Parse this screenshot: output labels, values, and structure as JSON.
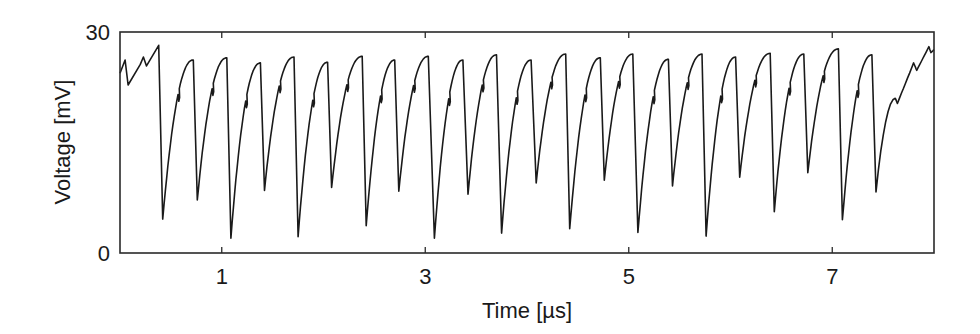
{
  "chart_data": {
    "type": "line",
    "title": "",
    "xlabel": "Time [µs]",
    "ylabel": "Voltage [mV]",
    "xlim": [
      0,
      8.0
    ],
    "ylim": [
      0,
      30
    ],
    "x_ticks": [
      1,
      3,
      5,
      7
    ],
    "x_tick_labels": [
      "1",
      "3",
      "5",
      "7"
    ],
    "y_ticks": [
      0,
      30
    ],
    "y_tick_labels": [
      "0",
      "30"
    ],
    "grid": false,
    "legend": null,
    "line_color": "#1a1a1a",
    "series": [
      {
        "name": "voltage",
        "description": "Sawtooth-like oscillation: slow concave rise with a small notch, then abrupt drop",
        "start": {
          "t": 0.0,
          "v": 24.4
        },
        "initial_segment": [
          {
            "t": 0.0,
            "v": 24.4
          },
          {
            "t": 0.05,
            "v": 26.2
          },
          {
            "t": 0.08,
            "v": 22.8
          },
          {
            "t": 0.2,
            "v": 25.6
          },
          {
            "t": 0.23,
            "v": 26.6
          },
          {
            "t": 0.26,
            "v": 25.4
          },
          {
            "t": 0.38,
            "v": 28.2
          }
        ],
        "peaks": [
          {
            "t": 0.38,
            "v": 28.2
          },
          {
            "t": 0.72,
            "v": 26.2
          },
          {
            "t": 1.05,
            "v": 26.5
          },
          {
            "t": 1.38,
            "v": 25.8
          },
          {
            "t": 1.71,
            "v": 26.6
          },
          {
            "t": 2.04,
            "v": 25.9
          },
          {
            "t": 2.38,
            "v": 26.7
          },
          {
            "t": 2.7,
            "v": 26.2
          },
          {
            "t": 3.03,
            "v": 26.7
          },
          {
            "t": 3.37,
            "v": 26.2
          },
          {
            "t": 3.7,
            "v": 26.9
          },
          {
            "t": 4.04,
            "v": 26.2
          },
          {
            "t": 4.38,
            "v": 27.0
          },
          {
            "t": 4.72,
            "v": 26.5
          },
          {
            "t": 5.04,
            "v": 27.0
          },
          {
            "t": 5.39,
            "v": 26.3
          },
          {
            "t": 5.72,
            "v": 27.0
          },
          {
            "t": 6.05,
            "v": 26.6
          },
          {
            "t": 6.39,
            "v": 27.1
          },
          {
            "t": 6.72,
            "v": 27.0
          },
          {
            "t": 7.06,
            "v": 27.7
          },
          {
            "t": 7.39,
            "v": 26.9
          }
        ],
        "troughs": [
          {
            "t": 0.42,
            "v": 4.6
          },
          {
            "t": 0.76,
            "v": 7.2
          },
          {
            "t": 1.09,
            "v": 2.0
          },
          {
            "t": 1.42,
            "v": 8.5
          },
          {
            "t": 1.75,
            "v": 2.2
          },
          {
            "t": 2.08,
            "v": 8.9
          },
          {
            "t": 2.42,
            "v": 3.7
          },
          {
            "t": 2.74,
            "v": 8.4
          },
          {
            "t": 3.09,
            "v": 2.0
          },
          {
            "t": 3.42,
            "v": 8.0
          },
          {
            "t": 3.75,
            "v": 2.7
          },
          {
            "t": 4.09,
            "v": 9.5
          },
          {
            "t": 4.42,
            "v": 3.3
          },
          {
            "t": 4.76,
            "v": 9.9
          },
          {
            "t": 5.09,
            "v": 2.8
          },
          {
            "t": 5.43,
            "v": 9.1
          },
          {
            "t": 5.76,
            "v": 2.3
          },
          {
            "t": 6.09,
            "v": 10.3
          },
          {
            "t": 6.43,
            "v": 5.6
          },
          {
            "t": 6.76,
            "v": 10.9
          },
          {
            "t": 7.1,
            "v": 4.5
          },
          {
            "t": 7.43,
            "v": 8.3
          }
        ],
        "final_segment": [
          {
            "t": 7.43,
            "v": 8.3
          },
          {
            "t": 7.62,
            "v": 21.0
          },
          {
            "t": 7.64,
            "v": 20.3
          },
          {
            "t": 7.8,
            "v": 25.8
          },
          {
            "t": 7.83,
            "v": 24.8
          },
          {
            "t": 7.95,
            "v": 28.0
          },
          {
            "t": 7.97,
            "v": 27.2
          },
          {
            "t": 8.0,
            "v": 27.6
          }
        ]
      }
    ]
  }
}
